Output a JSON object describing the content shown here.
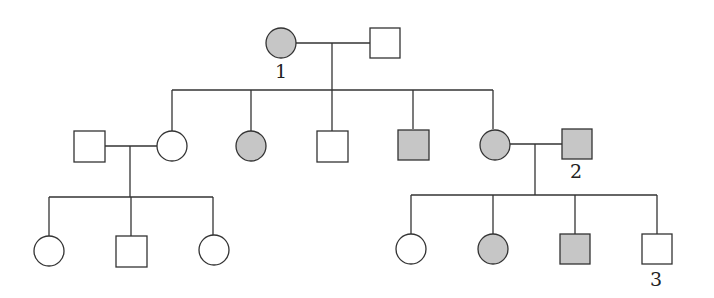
{
  "diagram": {
    "type": "pedigree",
    "colors": {
      "line": "#333333",
      "affected_fill": "#c6c6c6",
      "unaffected_fill": "#ffffff"
    },
    "legend": {
      "square": "male",
      "circle": "female",
      "shaded": "affected",
      "unshaded": "unaffected"
    },
    "individuals": [
      {
        "id": "g1-female",
        "generation": 1,
        "sex": "female",
        "affected": true,
        "label": "1"
      },
      {
        "id": "g1-male",
        "generation": 1,
        "sex": "male",
        "affected": false,
        "label": ""
      },
      {
        "id": "g2-spouse-male",
        "generation": 2,
        "sex": "male",
        "affected": false,
        "label": ""
      },
      {
        "id": "g2-child1",
        "generation": 2,
        "sex": "female",
        "affected": false,
        "label": ""
      },
      {
        "id": "g2-child2",
        "generation": 2,
        "sex": "female",
        "affected": true,
        "label": ""
      },
      {
        "id": "g2-child3",
        "generation": 2,
        "sex": "male",
        "affected": false,
        "label": ""
      },
      {
        "id": "g2-child4",
        "generation": 2,
        "sex": "male",
        "affected": true,
        "label": ""
      },
      {
        "id": "g2-child5",
        "generation": 2,
        "sex": "female",
        "affected": true,
        "label": ""
      },
      {
        "id": "g2-spouse-male-2",
        "generation": 2,
        "sex": "male",
        "affected": true,
        "label": "2"
      },
      {
        "id": "g3-left-1",
        "generation": 3,
        "sex": "female",
        "affected": false,
        "label": ""
      },
      {
        "id": "g3-left-2",
        "generation": 3,
        "sex": "male",
        "affected": false,
        "label": ""
      },
      {
        "id": "g3-left-3",
        "generation": 3,
        "sex": "female",
        "affected": false,
        "label": ""
      },
      {
        "id": "g3-right-1",
        "generation": 3,
        "sex": "female",
        "affected": false,
        "label": ""
      },
      {
        "id": "g3-right-2",
        "generation": 3,
        "sex": "female",
        "affected": true,
        "label": ""
      },
      {
        "id": "g3-right-3",
        "generation": 3,
        "sex": "male",
        "affected": true,
        "label": ""
      },
      {
        "id": "g3-right-4",
        "generation": 3,
        "sex": "male",
        "affected": false,
        "label": "3"
      }
    ],
    "labels": {
      "individual_1": "1",
      "individual_2": "2",
      "individual_3": "3"
    }
  }
}
